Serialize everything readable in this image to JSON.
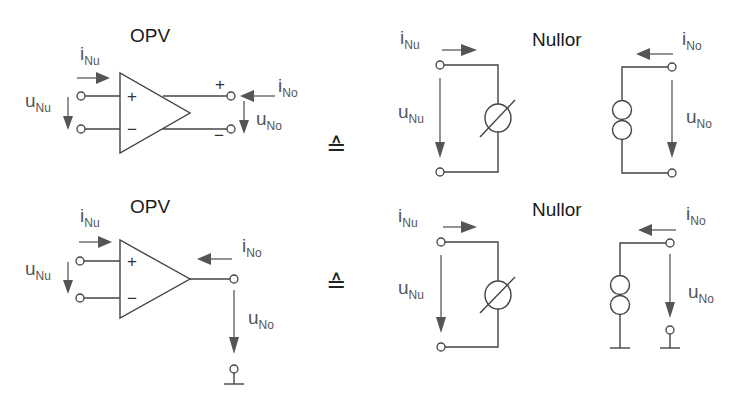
{
  "equivalence_symbol": "≙",
  "panels": [
    {
      "name": "top",
      "opv": {
        "title": "OPV",
        "input_current": {
          "base": "i",
          "sub": "Nu"
        },
        "input_voltage": {
          "base": "u",
          "sub": "Nu"
        },
        "output_current": {
          "base": "i",
          "sub": "No"
        },
        "output_voltage": {
          "base": "u",
          "sub": "No"
        },
        "in_plus": "+",
        "in_minus": "−",
        "out_plus": "+",
        "out_minus": "−"
      },
      "nullor": {
        "title": "Nullor",
        "input_current": {
          "base": "i",
          "sub": "Nu"
        },
        "input_voltage": {
          "base": "u",
          "sub": "Nu"
        },
        "output_current": {
          "base": "i",
          "sub": "No"
        },
        "output_voltage": {
          "base": "u",
          "sub": "No"
        },
        "input_element": "nullator",
        "output_element": "norator",
        "output_grounded": false
      }
    },
    {
      "name": "bottom",
      "opv": {
        "title": "OPV",
        "input_current": {
          "base": "i",
          "sub": "Nu"
        },
        "input_voltage": {
          "base": "u",
          "sub": "Nu"
        },
        "output_current": {
          "base": "i",
          "sub": "No"
        },
        "output_voltage": {
          "base": "u",
          "sub": "No"
        },
        "in_plus": "+",
        "in_minus": "−",
        "output_grounded": true
      },
      "nullor": {
        "title": "Nullor",
        "input_current": {
          "base": "i",
          "sub": "Nu"
        },
        "input_voltage": {
          "base": "u",
          "sub": "Nu"
        },
        "output_current": {
          "base": "i",
          "sub": "No"
        },
        "output_voltage": {
          "base": "u",
          "sub": "No"
        },
        "input_element": "nullator",
        "output_element": "norator",
        "output_grounded": true
      }
    }
  ]
}
